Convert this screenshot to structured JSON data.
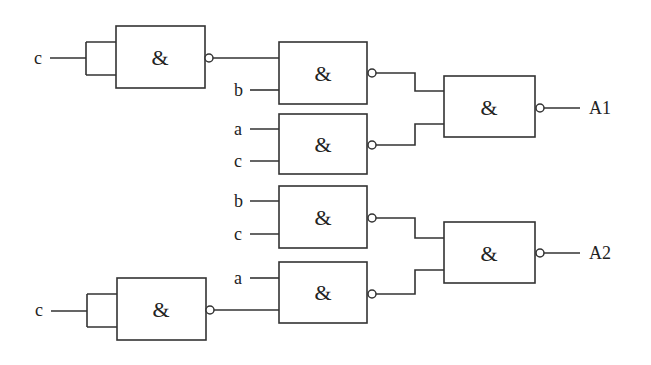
{
  "diagram": {
    "type": "logic-circuit",
    "gate_symbol": "&",
    "gates": [
      {
        "id": "g1",
        "kind": "NAND",
        "symbol": "&",
        "inputs": [
          "c",
          "c"
        ],
        "box": [
          116,
          26,
          89,
          62
        ]
      },
      {
        "id": "g2",
        "kind": "NAND",
        "symbol": "&",
        "inputs": [
          "g1",
          "b"
        ],
        "box": [
          279,
          42,
          88,
          62
        ]
      },
      {
        "id": "g3",
        "kind": "NAND",
        "symbol": "&",
        "inputs": [
          "a",
          "c"
        ],
        "box": [
          279,
          114,
          88,
          60
        ]
      },
      {
        "id": "g4",
        "kind": "NAND",
        "symbol": "&",
        "inputs": [
          "g2",
          "g3"
        ],
        "box": [
          444,
          76,
          91,
          61
        ],
        "output": "A1"
      },
      {
        "id": "g5",
        "kind": "NAND",
        "symbol": "&",
        "inputs": [
          "b",
          "c"
        ],
        "box": [
          279,
          186,
          88,
          62
        ]
      },
      {
        "id": "g6",
        "kind": "NAND",
        "symbol": "&",
        "inputs": [
          "a",
          "g7"
        ],
        "box": [
          279,
          262,
          88,
          61
        ]
      },
      {
        "id": "g7",
        "kind": "NAND",
        "symbol": "&",
        "inputs": [
          "c",
          "c"
        ],
        "box": [
          117,
          278,
          89,
          62
        ]
      },
      {
        "id": "g8",
        "kind": "NAND",
        "symbol": "&",
        "inputs": [
          "g5",
          "g6"
        ],
        "box": [
          444,
          222,
          91,
          61
        ],
        "output": "A2"
      }
    ],
    "input_labels": {
      "g1_c": "c",
      "g2_b": "b",
      "g3_a": "a",
      "g3_c": "c",
      "g5_b": "b",
      "g5_c": "c",
      "g6_a": "a",
      "g7_c": "c"
    },
    "outputs": {
      "A1": "A1",
      "A2": "A2"
    },
    "colors": {
      "line": "#333333",
      "background": "#ffffff",
      "text": "#222222"
    }
  }
}
